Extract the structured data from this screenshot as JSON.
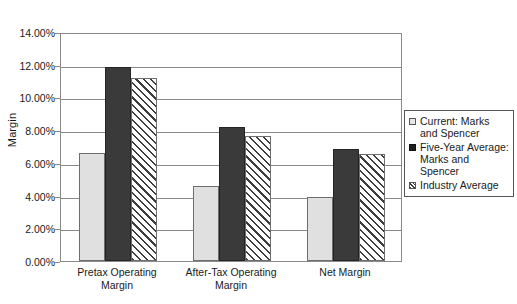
{
  "chart_data": {
    "type": "bar",
    "title": "",
    "xlabel": "",
    "ylabel": "Margin",
    "ylim": [
      0,
      0.14
    ],
    "ytick_labels": [
      "14.00%",
      "12.00%",
      "10.00%",
      "8.00%",
      "6.00%",
      "4.00%",
      "2.00%",
      "0.00%"
    ],
    "ytick_values": [
      0.14,
      0.12,
      0.1,
      0.08,
      0.06,
      0.04,
      0.02,
      0.0
    ],
    "grid": true,
    "legend_position": "right",
    "categories": [
      "Pretax Operating\nMargin",
      "After-Tax Operating\nMargin",
      "Net Margin"
    ],
    "series": [
      {
        "name": "Current: Marks\nand Spencer",
        "style": "light-gray-fill",
        "values": [
          0.066,
          0.046,
          0.039
        ]
      },
      {
        "name": "Five-Year Average:\nMarks and Spencer",
        "style": "black-fill",
        "values": [
          0.1185,
          0.082,
          0.0685
        ]
      },
      {
        "name": "Industry Average",
        "style": "diagonal-hatch",
        "values": [
          0.112,
          0.0765,
          0.0655
        ]
      }
    ]
  },
  "legend": {
    "items": [
      {
        "label": "Current: Marks\nand Spencer",
        "swatch": "light-gray-fill"
      },
      {
        "label": "Five-Year Average:\nMarks and Spencer",
        "swatch": "black-fill"
      },
      {
        "label": "Industry Average",
        "swatch": "diagonal-hatch"
      }
    ]
  },
  "colors": {
    "series_current": "#e0e0e0",
    "series_fiveyear": "#3a3a3a",
    "series_industry_hatch": "#3d3d3d",
    "axis": "#8a8a8a",
    "text": "#1a1a1a",
    "background": "#ffffff"
  }
}
